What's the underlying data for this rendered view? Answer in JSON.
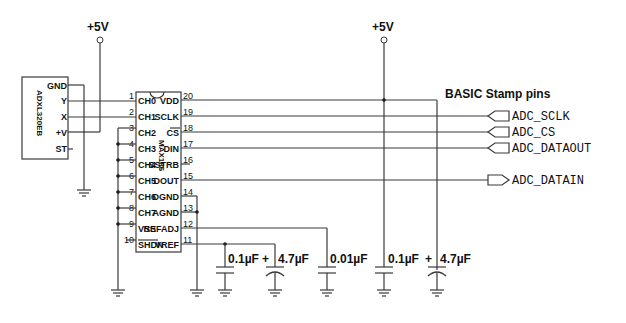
{
  "power": {
    "left_label": "+5V",
    "right_label": "+5V"
  },
  "accelerometer": {
    "name": "ADXL320EB",
    "pins": [
      "GND",
      "Y",
      "X",
      "+V",
      "ST"
    ]
  },
  "adc": {
    "name": "MAX186",
    "left_pins": [
      {
        "num": "1",
        "name": "CH0"
      },
      {
        "num": "2",
        "name": "CH1"
      },
      {
        "num": "3",
        "name": "CH2"
      },
      {
        "num": "4",
        "name": "CH3"
      },
      {
        "num": "5",
        "name": "CH4"
      },
      {
        "num": "6",
        "name": "CH5"
      },
      {
        "num": "7",
        "name": "CH6"
      },
      {
        "num": "8",
        "name": "CH7"
      },
      {
        "num": "9",
        "name": "VSS"
      },
      {
        "num": "10",
        "name": "SHDN"
      }
    ],
    "right_pins": [
      {
        "num": "20",
        "name": "VDD"
      },
      {
        "num": "19",
        "name": "SCLK"
      },
      {
        "num": "18",
        "name": "CS"
      },
      {
        "num": "17",
        "name": "DIN"
      },
      {
        "num": "16",
        "name": "SSTRB"
      },
      {
        "num": "15",
        "name": "DOUT"
      },
      {
        "num": "14",
        "name": "DGND"
      },
      {
        "num": "13",
        "name": "AGND"
      },
      {
        "num": "12",
        "name": "REFADJ"
      },
      {
        "num": "11",
        "name": "VREF"
      }
    ]
  },
  "stamp": {
    "title": "BASIC Stamp pins",
    "nets": [
      "ADC_SCLK",
      "ADC_CS",
      "ADC_DATAOUT",
      "ADC_DATAIN"
    ]
  },
  "capacitors": [
    {
      "value": "0.1µF",
      "polarized": false
    },
    {
      "value": "4.7µF",
      "polarized": true,
      "polarity": "+"
    },
    {
      "value": "0.01µF",
      "polarized": false
    },
    {
      "value": "0.1µF",
      "polarized": false
    },
    {
      "value": "4.7µF",
      "polarized": true,
      "polarity": "+"
    }
  ]
}
